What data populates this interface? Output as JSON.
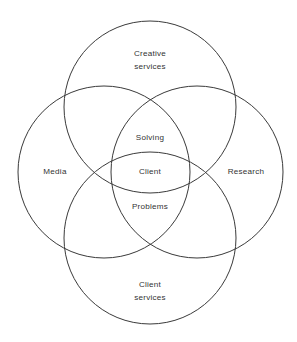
{
  "figure": {
    "kind": "four-set-venn-diagram",
    "background_color": "#ffffff",
    "stroke_color": "#3a3a3a",
    "text_color": "#333333"
  },
  "sets": [
    {
      "id": "creative-services",
      "position": "top",
      "label_lines": [
        "Creative",
        "services"
      ],
      "line1": "Creative",
      "line2": "services",
      "cx": 150,
      "cy": 107,
      "r": 86
    },
    {
      "id": "media",
      "position": "left",
      "label_lines": [
        "Media"
      ],
      "line1": "Media",
      "line2": "",
      "cx": 104,
      "cy": 172,
      "r": 86
    },
    {
      "id": "research",
      "position": "right",
      "label_lines": [
        "Research"
      ],
      "line1": "Research",
      "line2": "",
      "cx": 197,
      "cy": 172,
      "r": 86
    },
    {
      "id": "client-services",
      "position": "bottom",
      "label_lines": [
        "Client",
        "services"
      ],
      "line1": "Client",
      "line2": "services",
      "cx": 150,
      "cy": 238,
      "r": 86
    }
  ],
  "intersection": {
    "id": "central-intersection",
    "lines": [
      "Solving",
      "Client",
      "Problems"
    ],
    "line_top": "Solving",
    "line_middle": "Client",
    "line_bottom": "Problems",
    "phrase": "Solving Client Problems"
  }
}
